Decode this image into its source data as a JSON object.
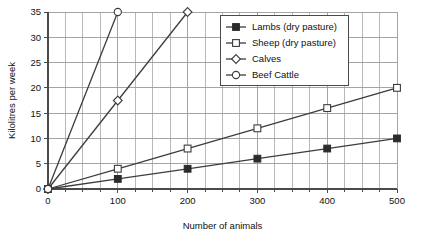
{
  "chart_data": {
    "type": "line",
    "title": "",
    "xlabel": "Number of animals",
    "ylabel": "Kilolitres per week",
    "xlim": [
      0,
      500
    ],
    "ylim": [
      0,
      35
    ],
    "x_ticks": [
      0,
      100,
      200,
      300,
      400,
      500
    ],
    "y_ticks": [
      0,
      5,
      10,
      15,
      20,
      25,
      30,
      35
    ],
    "x_minor_step": 25,
    "grid": "both",
    "legend_position": "top-right",
    "series": [
      {
        "name": "Lambs (dry pasture)",
        "marker": "filled-square",
        "x": [
          0,
          100,
          200,
          300,
          400,
          500
        ],
        "values": [
          0,
          2,
          4,
          6,
          8,
          10
        ]
      },
      {
        "name": "Sheep (dry pasture)",
        "marker": "open-square",
        "x": [
          0,
          100,
          200,
          300,
          400,
          500
        ],
        "values": [
          0,
          4,
          8,
          12,
          16,
          20
        ]
      },
      {
        "name": "Calves",
        "marker": "open-diamond",
        "x": [
          0,
          100,
          200
        ],
        "values": [
          0,
          17.5,
          35
        ]
      },
      {
        "name": "Beef Cattle",
        "marker": "open-circle",
        "x": [
          0,
          100
        ],
        "values": [
          0,
          35
        ]
      }
    ]
  },
  "axes": {
    "x_label": "Number of animals",
    "y_label": "Kilolitres per week",
    "x_tick_labels": [
      "0",
      "100",
      "200",
      "300",
      "400",
      "500"
    ],
    "y_tick_labels": [
      "0",
      "5",
      "10",
      "15",
      "20",
      "25",
      "30",
      "35"
    ]
  },
  "legend": {
    "items": [
      {
        "label": "Lambs (dry pasture)",
        "marker": "filled-square"
      },
      {
        "label": "Sheep (dry pasture)",
        "marker": "open-square"
      },
      {
        "label": "Calves",
        "marker": "open-diamond"
      },
      {
        "label": "Beef Cattle",
        "marker": "open-circle"
      }
    ]
  },
  "colors": {
    "line": "#3c3c3c",
    "marker_fill_dark": "#2b2b2b",
    "marker_fill_light": "#ffffff",
    "grid": "#9a9a9a",
    "axis": "#4a4a4a",
    "text": "#111111",
    "background": "#ffffff"
  }
}
